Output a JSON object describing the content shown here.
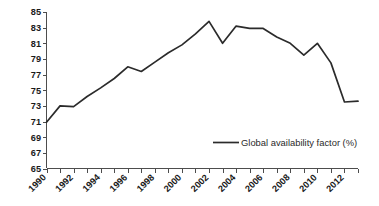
{
  "chart_data": {
    "type": "line",
    "title": "",
    "xlabel": "",
    "ylabel": "",
    "ylim": [
      65,
      85
    ],
    "ytick_step": 2,
    "ytick_labels": [
      "65",
      "67",
      "69",
      "71",
      "73",
      "75",
      "77",
      "79",
      "81",
      "83",
      "85"
    ],
    "xtick_labels": [
      "1990",
      "1992",
      "1994",
      "1996",
      "1998",
      "2000",
      "2002",
      "2004",
      "2006",
      "2008",
      "2010",
      "2012"
    ],
    "xtick_label_step": 2,
    "x": [
      1990,
      1991,
      1992,
      1993,
      1994,
      1995,
      1996,
      1997,
      1998,
      1999,
      2000,
      2001,
      2002,
      2003,
      2004,
      2005,
      2006,
      2007,
      2008,
      2009,
      2010,
      2011,
      2012,
      2013
    ],
    "xlim": [
      1990,
      2013
    ],
    "grid": false,
    "legend_position": "inside-lower-right",
    "series": [
      {
        "name": "Global availability factor (%)",
        "color": "#2b2b2b",
        "values": [
          70.9,
          73.0,
          72.9,
          74.2,
          75.3,
          76.5,
          78.0,
          77.4,
          78.6,
          79.8,
          80.8,
          82.2,
          83.8,
          81.0,
          83.2,
          82.9,
          82.9,
          81.8,
          81.0,
          79.5,
          81.0,
          78.5,
          73.5,
          73.6
        ]
      }
    ],
    "legend_entries": [
      "Global availability factor (%)"
    ]
  },
  "legend": {
    "label": "Global availability factor (%)"
  },
  "axes": {
    "y_axis_name": "value-axis",
    "x_axis_name": "year-axis"
  }
}
